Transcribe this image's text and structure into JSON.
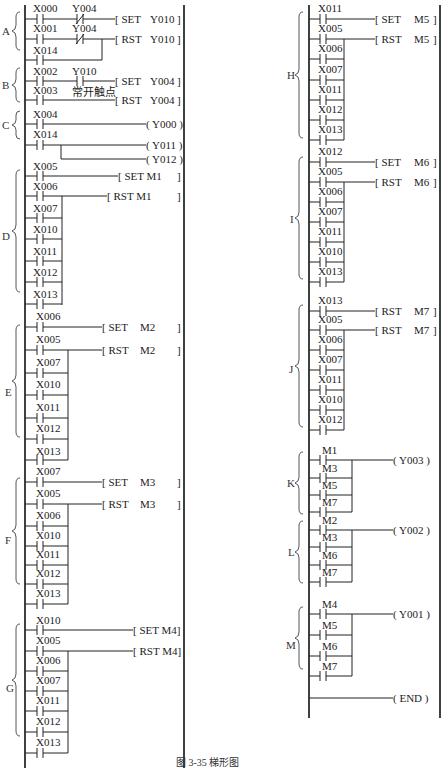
{
  "caption": "图 3-35  梯形图",
  "annotation": "常开触点",
  "sections": {
    "A": {
      "label": "A",
      "rungs": [
        {
          "contacts": [
            "X000",
            "Y004(NC)"
          ],
          "coil": "SET Y010"
        },
        {
          "contacts": [
            "X001",
            "Y004(NC)"
          ],
          "parallel": [
            "X014"
          ],
          "coil": "RST Y010"
        }
      ]
    },
    "B": {
      "label": "B",
      "rungs": [
        {
          "contacts": [
            "X002",
            "Y010"
          ],
          "coil": "SET Y004"
        },
        {
          "contacts": [
            "X003"
          ],
          "coil": "RST Y004"
        }
      ]
    },
    "C": {
      "label": "C",
      "rungs": [
        {
          "contacts": [
            "X004"
          ],
          "coil": "Y000"
        },
        {
          "contacts": [
            "X014"
          ],
          "coils": [
            "Y011",
            "Y012"
          ]
        }
      ]
    },
    "D": {
      "label": "D",
      "set": "X005",
      "reset": [
        "X006",
        "X007",
        "X010",
        "X011",
        "X012",
        "X013"
      ],
      "set_coil": "SET  M1",
      "rst_coil": "RST  M1"
    },
    "E": {
      "label": "E",
      "set": "X006",
      "reset": [
        "X005",
        "X007",
        "X010",
        "X011",
        "X012",
        "X013"
      ],
      "set_coil": "SET",
      "rst_coil": "RST",
      "device": "M2"
    },
    "F": {
      "label": "F",
      "set": "X007",
      "reset": [
        "X005",
        "X006",
        "X010",
        "X011",
        "X012",
        "X013"
      ],
      "set_coil": "SET",
      "rst_coil": "RST",
      "device": "M3"
    },
    "G": {
      "label": "G",
      "set": "X010",
      "reset": [
        "X005",
        "X006",
        "X007",
        "X011",
        "X012",
        "X013"
      ],
      "set_coil": "SET  M4",
      "rst_coil": "RST  M4"
    },
    "H": {
      "label": "H",
      "set": "X011",
      "reset": [
        "X005",
        "X006",
        "X007",
        "X011",
        "X012",
        "X013"
      ],
      "set_coil": "SET",
      "rst_coil": "RST",
      "device": "M5"
    },
    "I": {
      "label": "I",
      "set": "X012",
      "reset": [
        "X005",
        "X006",
        "X007",
        "X011",
        "X010",
        "X013"
      ],
      "set_coil": "SET",
      "rst_coil": "RST",
      "device": "M6"
    },
    "J": {
      "label": "J",
      "set": "X013",
      "reset": [
        "X005",
        "X006",
        "X007",
        "X011",
        "X010",
        "X012"
      ],
      "set_coil": "RST",
      "rst_coil": "RST",
      "device": "M7"
    },
    "K": {
      "label": "K",
      "contacts": [
        "M1",
        "M3",
        "M5",
        "M7"
      ],
      "coil": "Y003"
    },
    "L": {
      "label": "L",
      "contacts": [
        "M2",
        "M3",
        "M6",
        "M7"
      ],
      "coil": "Y002"
    },
    "M": {
      "label": "M",
      "contacts": [
        "M4",
        "M5",
        "M6",
        "M7"
      ],
      "coil": "Y001"
    },
    "END": {
      "coil": "END"
    }
  },
  "text": {
    "A_c1": "X000",
    "A_c2": "Y004",
    "A_set": "SET",
    "A_set_d": "Y010",
    "A_c3": "X001",
    "A_c4": "Y004",
    "A_rst": "RST",
    "A_rst_d": "Y010",
    "A_c5": "X014",
    "B_c1": "X002",
    "B_c2": "Y010",
    "B_set": "SET",
    "B_set_d": "Y004",
    "B_c3": "X003",
    "B_rst": "RST",
    "B_rst_d": "Y004",
    "C_c1": "X004",
    "C_o1": "Y000",
    "C_c2": "X014",
    "C_o2": "Y011",
    "C_o3": "Y012",
    "D_c": [
      "X005",
      "X006",
      "X007",
      "X010",
      "X011",
      "X012",
      "X013"
    ],
    "D_set": "SET  M1",
    "D_rst": "RST  M1",
    "E_c": [
      "X006",
      "X005",
      "X007",
      "X010",
      "X011",
      "X012",
      "X013"
    ],
    "E_set": "SET",
    "E_rst": "RST",
    "E_d": "M2",
    "F_c": [
      "X007",
      "X005",
      "X006",
      "X010",
      "X011",
      "X012",
      "X013"
    ],
    "F_set": "SET",
    "F_rst": "RST",
    "F_d": "M3",
    "G_c": [
      "X010",
      "X005",
      "X006",
      "X007",
      "X011",
      "X012",
      "X013"
    ],
    "G_set": "SET  M4",
    "G_rst": "RST  M4",
    "H_c": [
      "X011",
      "X005",
      "X006",
      "X007",
      "X011",
      "X012",
      "X013"
    ],
    "H_set": "SET",
    "H_rst": "RST",
    "H_d": "M5",
    "I_c": [
      "X012",
      "X005",
      "X006",
      "X007",
      "X011",
      "X010",
      "X013"
    ],
    "I_set": "SET",
    "I_rst": "RST",
    "I_d": "M6",
    "J_c": [
      "X013",
      "X005",
      "X006",
      "X007",
      "X011",
      "X010",
      "X012"
    ],
    "J_set": "RST",
    "J_rst": "RST",
    "J_d": "M7",
    "K_c": [
      "M1",
      "M3",
      "M5",
      "M7"
    ],
    "K_o": "Y003",
    "L_c": [
      "M2",
      "M3",
      "M6",
      "M7"
    ],
    "L_o": "Y002",
    "M_c": [
      "M4",
      "M5",
      "M6",
      "M7"
    ],
    "M_o": "Y001",
    "END": "END"
  },
  "labels": {
    "A": "A",
    "B": "B",
    "C": "C",
    "D": "D",
    "E": "E",
    "F": "F",
    "G": "G",
    "H": "H",
    "I": "I",
    "J": "J",
    "K": "K",
    "L": "L",
    "M": "M"
  }
}
